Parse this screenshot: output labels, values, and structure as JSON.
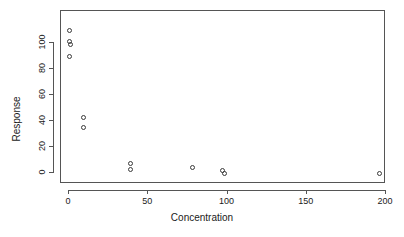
{
  "chart_data": {
    "type": "scatter",
    "title": "",
    "xlabel": "Concentration",
    "ylabel": "Response",
    "xlim": [
      -5,
      205
    ],
    "ylim": [
      -5,
      115
    ],
    "grid": false,
    "legend": null,
    "marker": "open-circle",
    "xticks": [
      0,
      50,
      100,
      150,
      200
    ],
    "xtick_labels": [
      "0",
      "50",
      "100",
      "150",
      "200"
    ],
    "yticks": [
      0,
      20,
      40,
      60,
      80,
      100
    ],
    "ytick_labels": [
      "0",
      "20",
      "40",
      "60",
      "80",
      "100"
    ],
    "points": [
      {
        "x": 0,
        "y": 110
      },
      {
        "x": 0,
        "y": 101
      },
      {
        "x": 1,
        "y": 99
      },
      {
        "x": 0,
        "y": 90
      },
      {
        "x": 9,
        "y": 43
      },
      {
        "x": 9,
        "y": 35
      },
      {
        "x": 39,
        "y": 7
      },
      {
        "x": 39,
        "y": 3
      },
      {
        "x": 78,
        "y": 4
      },
      {
        "x": 97,
        "y": 2
      },
      {
        "x": 98,
        "y": 0
      },
      {
        "x": 196,
        "y": 0
      }
    ]
  },
  "colors": {
    "axis": "#555555",
    "marker_stroke": "#3a3a3a",
    "text": "#1a1a1a",
    "background": "#ffffff"
  }
}
